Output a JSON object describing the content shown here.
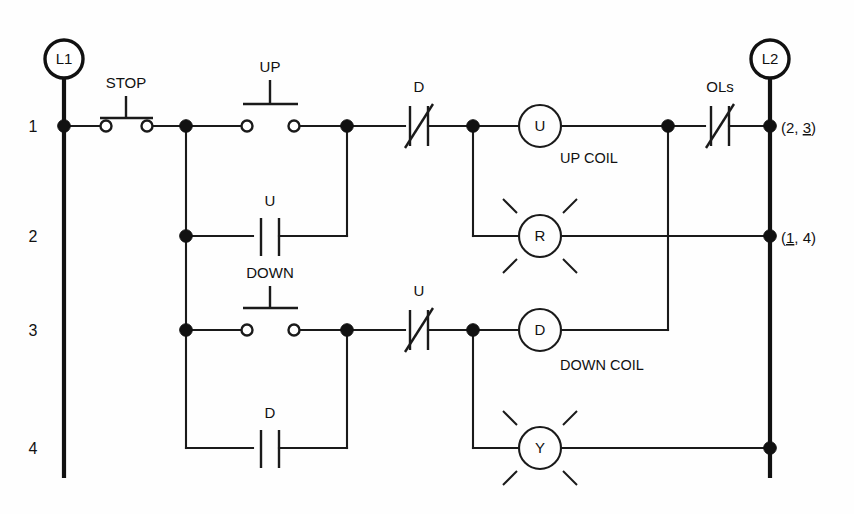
{
  "diagram": {
    "type": "ladder-logic",
    "rails": {
      "left": {
        "label": "L1",
        "x": 64
      },
      "right": {
        "label": "L2",
        "x": 770
      }
    },
    "rungs": [
      {
        "number": "1",
        "y": 126
      },
      {
        "number": "2",
        "y": 236
      },
      {
        "number": "3",
        "y": 330
      },
      {
        "number": "4",
        "y": 448
      }
    ],
    "cross_references": [
      {
        "text_prefix": "(2, ",
        "underlined": "3",
        "text_suffix": ")",
        "full": "(2, 3)",
        "rung": "1"
      },
      {
        "text_prefix": "(",
        "underlined": "1",
        "text_suffix": ", 4)",
        "full": "(1, 4)",
        "rung": "2"
      }
    ],
    "devices": [
      {
        "id": "stop-pb",
        "label": "STOP",
        "kind": "pushbutton-nc",
        "rung": "1"
      },
      {
        "id": "up-pb",
        "label": "UP",
        "kind": "pushbutton-no",
        "rung": "1"
      },
      {
        "id": "d-nc",
        "label": "D",
        "kind": "contact-nc",
        "rung": "1"
      },
      {
        "id": "u-coil",
        "label": "U",
        "kind": "coil",
        "rung": "1",
        "caption": "UP COIL"
      },
      {
        "id": "ols",
        "label": "OLs",
        "kind": "contact-nc",
        "rung": "1"
      },
      {
        "id": "u-seal",
        "label": "U",
        "kind": "contact-no",
        "rung": "2"
      },
      {
        "id": "r-lamp",
        "label": "R",
        "kind": "lamp",
        "rung": "2"
      },
      {
        "id": "down-pb",
        "label": "DOWN",
        "kind": "pushbutton-no",
        "rung": "3"
      },
      {
        "id": "u-nc",
        "label": "U",
        "kind": "contact-nc",
        "rung": "3"
      },
      {
        "id": "d-coil",
        "label": "D",
        "kind": "coil",
        "rung": "3",
        "caption": "DOWN COIL"
      },
      {
        "id": "d-seal",
        "label": "D",
        "kind": "contact-no",
        "rung": "4"
      },
      {
        "id": "y-lamp",
        "label": "Y",
        "kind": "lamp",
        "rung": "4"
      }
    ],
    "captions": [
      {
        "text": "UP COIL",
        "x": 560,
        "y": 158
      },
      {
        "text": "DOWN COIL",
        "x": 560,
        "y": 365
      }
    ],
    "colors": {
      "line": "#1a1a1a",
      "rail": "#111111",
      "background": "#ffffff",
      "text": "#111111"
    }
  }
}
